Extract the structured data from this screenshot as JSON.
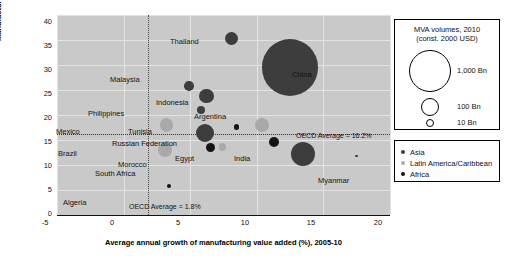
{
  "chart_data": {
    "type": "scatter",
    "title": "",
    "xlabel": "Average annual growth of manufacturing value added (%), 2005-10",
    "ylabel": "Manufacturing value added (% GDP), 2010",
    "xlim": [
      -5,
      20
    ],
    "ylim": [
      0,
      40
    ],
    "xticks": [
      "-5",
      "0",
      "5",
      "10",
      "15",
      "20"
    ],
    "yticks": [
      "0",
      "5",
      "10",
      "15",
      "20",
      "25",
      "30",
      "35",
      "40"
    ],
    "grid": true,
    "legend_position": "right",
    "reference_lines": [
      {
        "orientation": "vertical",
        "value": 1.8,
        "label": "OECD Average = 1.8%"
      },
      {
        "orientation": "horizontal",
        "value": 16.2,
        "label": "OECD Average = 16.2%"
      }
    ],
    "series": [
      {
        "name": "Asia",
        "color": "#3d3d3d",
        "points": [
          {
            "label": "China",
            "x": 12.5,
            "y": 29.5,
            "size": 2200
          },
          {
            "label": "Thailand",
            "x": 8.1,
            "y": 35.3,
            "size": 120
          },
          {
            "label": "Malaysia",
            "x": 4.9,
            "y": 25.8,
            "size": 65
          },
          {
            "label": "Indonesia",
            "x": 6.2,
            "y": 23.8,
            "size": 150
          },
          {
            "label": "Philippines",
            "x": 5.8,
            "y": 21.0,
            "size": 45
          },
          {
            "label": "India",
            "x": 13.5,
            "y": 12.2,
            "size": 400
          },
          {
            "label": "Russian Federation",
            "x": 6.1,
            "y": 16.4,
            "size": 230
          },
          {
            "label": "Myanmar",
            "x": 17.5,
            "y": 11.8,
            "size": 6
          }
        ]
      },
      {
        "name": "Latin America/Caribbean",
        "color": "#a9a9a9",
        "points": [
          {
            "label": "Argentina",
            "x": 10.4,
            "y": 18.0,
            "size": 140
          },
          {
            "label": "Mexico",
            "x": 3.2,
            "y": 18.0,
            "size": 120
          },
          {
            "label": "Brazil",
            "x": 3.1,
            "y": 13.0,
            "size": 130
          },
          {
            "label": "Morocco",
            "x": 7.4,
            "y": 13.6,
            "size": 35
          }
        ]
      },
      {
        "name": "Africa",
        "color": "#141414",
        "points": [
          {
            "label": "Tunisia",
            "x": 8.5,
            "y": 17.6,
            "size": 20
          },
          {
            "label": "Egypt",
            "x": 11.3,
            "y": 14.6,
            "size": 80
          },
          {
            "label": "South Africa",
            "x": 6.5,
            "y": 13.5,
            "size": 55
          },
          {
            "label": "Algeria",
            "x": 3.4,
            "y": 5.8,
            "size": 14
          }
        ]
      }
    ]
  },
  "axes": {
    "y_title": "Manufacturing value added (% GDP), 2010",
    "x_title": "Average annual growth of manufacturing value added (%), 2005-10",
    "y_ticks": [
      {
        "value": "40",
        "top": 17
      },
      {
        "value": "35",
        "top": 41
      },
      {
        "value": "30",
        "top": 65
      },
      {
        "value": "25",
        "top": 89
      },
      {
        "value": "20",
        "top": 113
      },
      {
        "value": "15",
        "top": 137
      },
      {
        "value": "10",
        "top": 161
      },
      {
        "value": "5",
        "top": 185
      },
      {
        "value": "0",
        "top": 209
      }
    ],
    "x_ticks": [
      {
        "value": "-5",
        "left": 45
      },
      {
        "value": "0",
        "left": 112
      },
      {
        "value": "5",
        "left": 178
      },
      {
        "value": "10",
        "left": 245
      },
      {
        "value": "15",
        "left": 311
      },
      {
        "value": "20",
        "left": 378
      }
    ]
  },
  "reference_notes": {
    "vertical": "OECD Average = 1.8%",
    "horizontal": "OECD Average = 16.2%"
  },
  "size_legend": {
    "title_line1": "MVA volumes, 2010",
    "title_line2": "(const. 2000 USD)",
    "entries": [
      {
        "label": "1,000 Bn",
        "radius": 20
      },
      {
        "label": "100 Bn",
        "radius": 8
      },
      {
        "label": "10 Bn",
        "radius": 3
      }
    ]
  },
  "category_legend": {
    "entries": [
      {
        "label": "Asia",
        "color": "#3d3d3d"
      },
      {
        "label": "Latin America/Caribbean",
        "color": "#a9a9a9"
      },
      {
        "label": "Africa",
        "color": "#141414"
      }
    ]
  },
  "point_labels": [
    {
      "name": "China",
      "left": 292,
      "top": 71
    },
    {
      "name": "Thailand",
      "left": 170,
      "top": 38
    },
    {
      "name": "Malaysia",
      "left": 110,
      "top": 76
    },
    {
      "name": "Indonesia",
      "left": 156,
      "top": 99
    },
    {
      "name": "Philippines",
      "left": 88,
      "top": 110
    },
    {
      "name": "Argentina",
      "left": 194,
      "top": 113
    },
    {
      "name": "Mexico",
      "left": 56,
      "top": 128
    },
    {
      "name": "Tunisia",
      "left": 128,
      "top": 128
    },
    {
      "name": "Russian Federation",
      "left": 112,
      "top": 140
    },
    {
      "name": "Brazil",
      "left": 58,
      "top": 150
    },
    {
      "name": "Egypt",
      "left": 175,
      "top": 155
    },
    {
      "name": "India",
      "left": 234,
      "top": 155
    },
    {
      "name": "Morocco",
      "left": 118,
      "top": 161
    },
    {
      "name": "South Africa",
      "left": 95,
      "top": 170
    },
    {
      "name": "Myanmar",
      "left": 318,
      "top": 177
    },
    {
      "name": "Algeria",
      "left": 63,
      "top": 199
    }
  ]
}
